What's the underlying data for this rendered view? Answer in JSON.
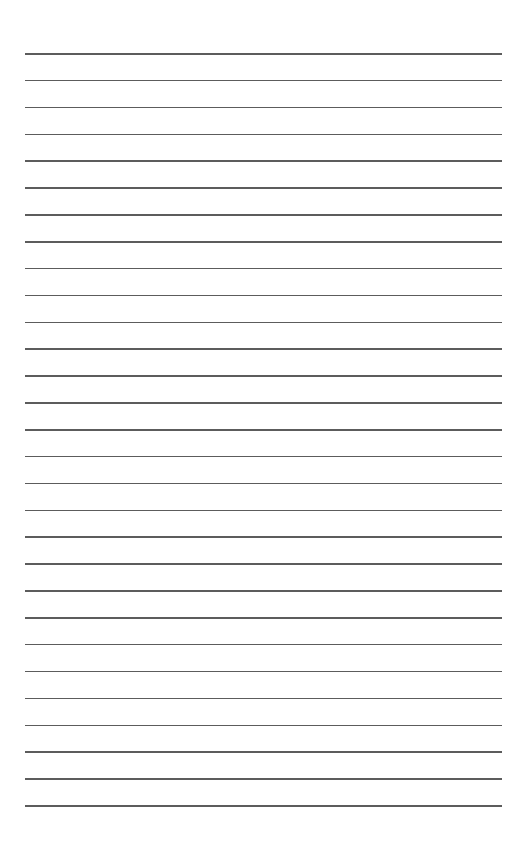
{
  "page": {
    "type": "lined-paper",
    "background_color": "#ffffff",
    "line_color": "#4a4a4a",
    "line_count": 29,
    "first_line_y": 53,
    "line_spacing": 26.86,
    "line_left": 25,
    "line_right": 502
  }
}
